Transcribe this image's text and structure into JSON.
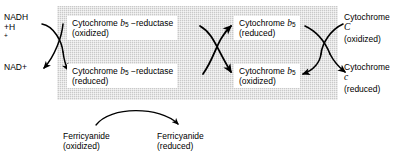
{
  "diagram": {
    "band": {
      "fill_color": "#c9c9c9"
    },
    "line_color": "#000000"
  },
  "substrates": {
    "nadh": {
      "line1": "NADH",
      "line2": "+H",
      "line2_sup": "+"
    },
    "nad_plus": {
      "line1": "NAD+"
    }
  },
  "enzymes": {
    "reductase_oxidized": {
      "name_prefix": "Cytochrome ",
      "symbol": "b",
      "subscript": "5",
      "name_suffix": " −reductase",
      "state": "(oxidized)"
    },
    "reductase_reduced": {
      "name_prefix": "Cytochrome ",
      "symbol": "b",
      "subscript": "5",
      "name_suffix": " −reductase",
      "state": "(reduced)"
    }
  },
  "carriers": {
    "b5_reduced": {
      "name_prefix": "Cytochrome ",
      "symbol": "b",
      "subscript": "5",
      "state": "(reduced)"
    },
    "b5_oxidized": {
      "name_prefix": "Cytochrome ",
      "symbol": "b",
      "subscript": "5",
      "state": "(oxidized)"
    },
    "cytc_oxidized": {
      "name_prefix": "Cytochrome ",
      "symbol": "C",
      "state": "(oxidized)"
    },
    "cytc_reduced": {
      "name_prefix": "Cytochrome ",
      "symbol": "c",
      "state": "(reduced)"
    }
  },
  "side_reaction": {
    "ferricyanide_oxidized": {
      "line1": "Ferricyanide",
      "line2": "(oxidized)"
    },
    "ferricyanide_reduced": {
      "line1": "Ferricyanide",
      "line2": "(reduced)"
    }
  }
}
